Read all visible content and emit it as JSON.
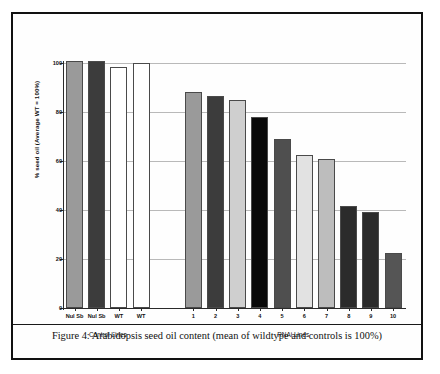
{
  "figure": {
    "caption": "Figure 4: Arabidopsis seed oil content (mean of wildtype and controls is 100%)"
  },
  "chart_data": {
    "type": "bar",
    "title": "",
    "xlabel": "",
    "ylabel": "% seed oil (Average WT = 100%)",
    "ylim": [
      0,
      100
    ],
    "yticks": [
      0,
      20,
      40,
      60,
      80,
      100
    ],
    "grid": true,
    "legend": "none",
    "groups": [
      {
        "name": "Control Lines",
        "label": "Control Lines"
      },
      {
        "name": "RNAi Lines",
        "label": "RNAi Lines"
      }
    ],
    "categories": [
      "Nul Sb",
      "Nul Sb",
      "WT",
      "WT",
      "1",
      "2",
      "3",
      "4",
      "5",
      "6",
      "7",
      "8",
      "9",
      "10"
    ],
    "values": [
      101,
      101,
      98.5,
      100,
      88,
      86.5,
      85,
      78,
      69,
      62.5,
      61,
      41.5,
      39,
      22.5
    ],
    "bars": [
      {
        "label": "Nul Sb",
        "value": 101,
        "group": "Control Lines",
        "color": "#9a9a9a"
      },
      {
        "label": "Nul Sb",
        "value": 101,
        "group": "Control Lines",
        "color": "#3c3c3c"
      },
      {
        "label": "WT",
        "value": 98.5,
        "group": "Control Lines",
        "color": "#ffffff"
      },
      {
        "label": "WT",
        "value": 100,
        "group": "Control Lines",
        "color": "#ffffff"
      },
      {
        "label": "1",
        "value": 88,
        "group": "RNAi Lines",
        "color": "#9a9a9a"
      },
      {
        "label": "2",
        "value": 86.5,
        "group": "RNAi Lines",
        "color": "#3c3c3c"
      },
      {
        "label": "3",
        "value": 85,
        "group": "RNAi Lines",
        "color": "#cfcfcf"
      },
      {
        "label": "4",
        "value": 78,
        "group": "RNAi Lines",
        "color": "#0a0a0a"
      },
      {
        "label": "5",
        "value": 69,
        "group": "RNAi Lines",
        "color": "#4f4f4f"
      },
      {
        "label": "6",
        "value": 62.5,
        "group": "RNAi Lines",
        "color": "#e2e2e2"
      },
      {
        "label": "7",
        "value": 61,
        "group": "RNAi Lines",
        "color": "#bdbdbd"
      },
      {
        "label": "8",
        "value": 41.5,
        "group": "RNAi Lines",
        "color": "#2b2b2b"
      },
      {
        "label": "9",
        "value": 39,
        "group": "RNAi Lines",
        "color": "#2b2b2b"
      },
      {
        "label": "10",
        "value": 22.5,
        "group": "RNAi Lines",
        "color": "#555555"
      }
    ]
  }
}
